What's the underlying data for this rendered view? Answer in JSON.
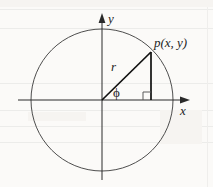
{
  "figure": {
    "background_color": "#fbfaf8",
    "ink_color": "#1d1d1d",
    "width": 213,
    "height": 187
  },
  "axes": {
    "y_axis_label": "y",
    "x_axis_label": "x",
    "origin": {
      "x": 102,
      "y": 100
    }
  },
  "circle": {
    "center_x": 102,
    "center_y": 100,
    "radius": 71,
    "stroke_color": "#3a3a3a"
  },
  "point": {
    "label": "p(x, y)",
    "x": 151,
    "y": 52
  },
  "radius_segment": {
    "label": "r",
    "from_x": 102,
    "from_y": 100,
    "to_x": 151,
    "to_y": 52
  },
  "drop_line": {
    "from_x": 151,
    "from_y": 52,
    "to_x": 151,
    "to_y": 100
  },
  "angle": {
    "label": "ϕ",
    "name": "phi"
  },
  "right_angle_marker": {
    "size": 8,
    "corner_x": 151,
    "corner_y": 100
  }
}
